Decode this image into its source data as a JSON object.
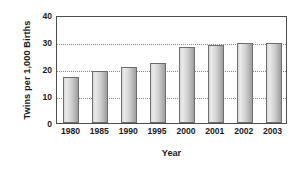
{
  "chart_data": {
    "type": "bar",
    "title": "",
    "xlabel": "Year",
    "ylabel": "Twins per 1,000 Births",
    "categories": [
      "1980",
      "1985",
      "1990",
      "1995",
      "2000",
      "2001",
      "2002",
      "2003"
    ],
    "values": [
      17.2,
      19.1,
      20.6,
      22.4,
      28.2,
      28.8,
      29.8,
      29.8
    ],
    "series": [
      {
        "name": "Twins per 1,000 Births",
        "values": [
          17.2,
          19.1,
          20.6,
          22.4,
          28.2,
          28.8,
          29.8,
          29.8
        ]
      }
    ],
    "ylim": [
      0,
      40
    ],
    "yticks": [
      0,
      10,
      20,
      30,
      40
    ],
    "ytick_labels": [
      "0",
      "10",
      "20",
      "30",
      "40"
    ],
    "grid": true,
    "grid_axis": "y",
    "legend": false,
    "legend_position": "none",
    "bar_color": "#cfcfcf",
    "bar_border_color": "#6e6e6e",
    "axis_color": "#4d4d4d",
    "grid_color": "#8a8a8a",
    "text_color": "#1b1b1b",
    "background": "#ffffff"
  }
}
